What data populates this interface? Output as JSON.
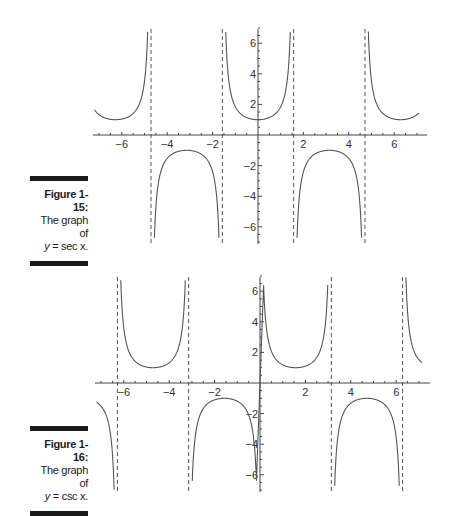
{
  "figures": [
    {
      "number_label": "Figure 1-15:",
      "line1": "The graph of",
      "line2_prefix": "y",
      "line2_rest": " = sec x."
    },
    {
      "number_label": "Figure 1-16:",
      "line1": "The graph of",
      "line2_prefix": "y",
      "line2_rest": " = csc x."
    }
  ],
  "chart_data": [
    {
      "type": "line",
      "title": "The graph of y = sec x.",
      "function": "sec",
      "xlim": [
        -7.2,
        7.2
      ],
      "ylim": [
        -7,
        7
      ],
      "x_ticks": [
        -6,
        -4,
        -2,
        2,
        4,
        6
      ],
      "y_ticks": [
        -6,
        -4,
        -2,
        2,
        4,
        6
      ],
      "asymptotes": [
        -4.712,
        -1.571,
        1.571,
        4.712
      ],
      "asymptote_style": "dashed",
      "grid": false
    },
    {
      "type": "line",
      "title": "The graph of y = csc x.",
      "function": "csc",
      "xlim": [
        -7.2,
        7.2
      ],
      "ylim": [
        -7,
        7
      ],
      "x_ticks": [
        -6,
        -4,
        -2,
        2,
        4,
        6
      ],
      "y_ticks": [
        -6,
        -4,
        -2,
        2,
        4,
        6
      ],
      "asymptotes": [
        -6.283,
        -3.142,
        3.142,
        6.283
      ],
      "asymptote_style": "dashed",
      "grid": false
    }
  ]
}
